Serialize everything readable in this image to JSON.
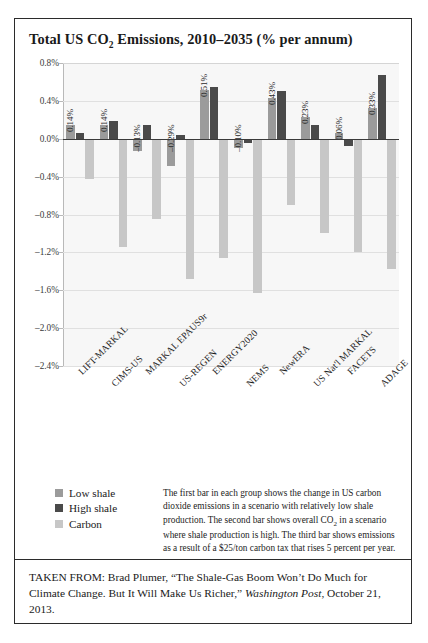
{
  "figure": {
    "title_main": "Total US CO",
    "title_sub": "2",
    "title_rest": " Emissions, 2010–2035 (% per annum)"
  },
  "legend": {
    "items": [
      {
        "label": "Low shale",
        "color": "#9b9b9b",
        "icon": "square-swatch"
      },
      {
        "label": "High shale",
        "color": "#4a4a4a",
        "icon": "square-swatch"
      },
      {
        "label": "Carbon",
        "color": "#c7c7c7",
        "icon": "square-swatch"
      }
    ]
  },
  "note": {
    "part1": "The first bar in each group shows the change in US carbon dioxide emissions in a scenario with relatively low shale production. The second bar shows overall CO",
    "sub": "2",
    "part2": " in a scenario where shale production is high. The third bar shows emissions as a result of a $25/ton carbon tax that rises 5 percent per year."
  },
  "source": {
    "prefix": "TAKEN FROM: Brad Plumer, “The Shale-Gas Boom Won’t Do Much for Climate Change. But It Will Make Us Richer,” ",
    "publication": "Washington Post",
    "suffix": ", October 21, 2013."
  },
  "chart_data": {
    "type": "bar",
    "title": "Total US CO2 Emissions, 2010–2035 (% per annum)",
    "xlabel": "",
    "ylabel": "",
    "ylim": [
      -2.4,
      0.8
    ],
    "ytick_labels": [
      "0.8%",
      "0.4%",
      "0.0%",
      "-0.4%",
      "-0.8%",
      "-1.2%",
      "-1.6%",
      "-2.0%",
      "-2.4%"
    ],
    "ytick_values": [
      0.8,
      0.4,
      0.0,
      -0.4,
      -0.8,
      -1.2,
      -1.6,
      -2.0,
      -2.4
    ],
    "grid": true,
    "legend_position": "below-left",
    "categories": [
      "LIFT-MARKAL",
      "CIMS-US",
      "MARKAL EPAUS9r",
      "US-REGEN",
      "ENERGY2020",
      "NEMS",
      "NewERA",
      "US Nat'l MARKAL",
      "FACETS",
      "ADAGE"
    ],
    "series": [
      {
        "name": "Low shale",
        "color": "#9b9b9b",
        "values": [
          0.14,
          0.14,
          -0.13,
          -0.29,
          0.51,
          -0.1,
          0.43,
          0.23,
          0.06,
          0.33
        ]
      },
      {
        "name": "High shale",
        "color": "#4a4a4a",
        "values": [
          0.06,
          0.19,
          0.14,
          0.04,
          0.55,
          -0.04,
          0.5,
          0.14,
          -0.08,
          0.67
        ]
      },
      {
        "name": "Carbon",
        "color": "#c7c7c7",
        "values": [
          -0.42,
          -1.14,
          -0.85,
          -1.48,
          -1.26,
          -1.63,
          -0.7,
          -1.0,
          -1.2,
          -1.38
        ]
      }
    ],
    "data_labels": [
      "0.14%",
      "0.14%",
      "-0.13%",
      "-0.29%",
      "0.51%",
      "-0.10%",
      "0.43%",
      "0.23%",
      "0.06%",
      "0.33%"
    ]
  }
}
